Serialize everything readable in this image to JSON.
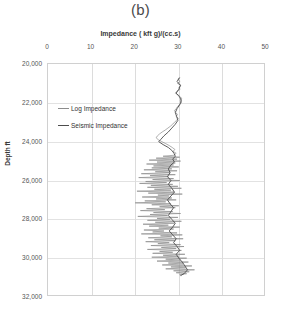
{
  "panel_label": "(b)",
  "axis": {
    "x_title": "Impedance ( kft g)/(cc.s)",
    "y_title": "Depth ft",
    "x_ticks": [
      "0",
      "10",
      "20",
      "30",
      "40",
      "50"
    ],
    "y_ticks": [
      "20,000",
      "22,000",
      "24,000",
      "26,000",
      "28,000",
      "30,000",
      "32,000"
    ]
  },
  "legend": {
    "items": [
      {
        "label": "Log Impedance",
        "color": "#8c8c8c"
      },
      {
        "label": "Seismic Impedance",
        "color": "#4d4d4d"
      }
    ]
  },
  "chart_data": {
    "type": "line",
    "title": "(b)",
    "xlabel": "Impedance ( kft g)/(cc.s)",
    "ylabel": "Depth ft",
    "xlim": [
      0,
      50
    ],
    "ylim": [
      32000,
      20000
    ],
    "y_inverted": true,
    "grid": true,
    "legend_position": "inside-upper-left",
    "xticks": [
      0,
      10,
      20,
      30,
      40,
      50
    ],
    "yticks": [
      20000,
      22000,
      24000,
      26000,
      28000,
      30000,
      32000
    ],
    "series": [
      {
        "name": "Seismic Impedance",
        "color": "#4d4d4d",
        "linewidth": 0.9,
        "comment": "smooth low-frequency trend, depth ft vs impedance kft g/(cc.s)",
        "points": [
          [
            20700,
            30.2
          ],
          [
            20900,
            29.6
          ],
          [
            21100,
            30.4
          ],
          [
            21300,
            30.0
          ],
          [
            21500,
            29.4
          ],
          [
            21700,
            30.2
          ],
          [
            21900,
            30.6
          ],
          [
            22100,
            30.2
          ],
          [
            22300,
            29.6
          ],
          [
            22500,
            29.2
          ],
          [
            22700,
            29.5
          ],
          [
            22900,
            29.8
          ],
          [
            23100,
            29.2
          ],
          [
            23300,
            28.4
          ],
          [
            23500,
            27.6
          ],
          [
            23700,
            26.6
          ],
          [
            23900,
            25.8
          ],
          [
            24000,
            25.4
          ],
          [
            24150,
            26.4
          ],
          [
            24300,
            27.6
          ],
          [
            24450,
            28.4
          ],
          [
            24600,
            28.9
          ],
          [
            24750,
            29.2
          ],
          [
            24900,
            28.6
          ],
          [
            25050,
            29.0
          ],
          [
            25200,
            28.2
          ],
          [
            25400,
            27.6
          ],
          [
            25600,
            28.0
          ],
          [
            25800,
            27.4
          ],
          [
            26000,
            28.2
          ],
          [
            26200,
            27.6
          ],
          [
            26400,
            28.4
          ],
          [
            26600,
            29.0
          ],
          [
            26800,
            28.2
          ],
          [
            27000,
            27.4
          ],
          [
            27200,
            28.0
          ],
          [
            27400,
            28.8
          ],
          [
            27600,
            28.2
          ],
          [
            27800,
            27.6
          ],
          [
            28000,
            28.4
          ],
          [
            28200,
            29.2
          ],
          [
            28400,
            28.6
          ],
          [
            28600,
            27.8
          ],
          [
            28800,
            28.6
          ],
          [
            29000,
            29.4
          ],
          [
            29200,
            28.8
          ],
          [
            29400,
            29.6
          ],
          [
            29600,
            30.2
          ],
          [
            29800,
            29.4
          ],
          [
            30000,
            30.0
          ],
          [
            30200,
            30.8
          ],
          [
            30400,
            31.4
          ],
          [
            30600,
            32.0
          ],
          [
            30800,
            31.2
          ],
          [
            30900,
            30.4
          ]
        ]
      },
      {
        "name": "Log Impedance",
        "color": "#8c8c8c",
        "linewidth": 0.7,
        "comment": "high-frequency well-log trace; amplitude small above ~24,700 ft, large below",
        "points": [
          [
            20700,
            30.1
          ],
          [
            20800,
            29.8
          ],
          [
            20900,
            30.3
          ],
          [
            21000,
            29.7
          ],
          [
            21100,
            30.5
          ],
          [
            21200,
            30.0
          ],
          [
            21300,
            30.3
          ],
          [
            21400,
            29.6
          ],
          [
            21500,
            29.2
          ],
          [
            21600,
            29.9
          ],
          [
            21700,
            30.4
          ],
          [
            21800,
            30.7
          ],
          [
            21900,
            30.3
          ],
          [
            22000,
            30.6
          ],
          [
            22100,
            30.1
          ],
          [
            22200,
            29.7
          ],
          [
            22300,
            29.4
          ],
          [
            22400,
            29.0
          ],
          [
            22500,
            29.3
          ],
          [
            22600,
            29.7
          ],
          [
            22700,
            29.4
          ],
          [
            22800,
            29.9
          ],
          [
            22900,
            29.5
          ],
          [
            23000,
            29.0
          ],
          [
            23100,
            28.6
          ],
          [
            23200,
            28.1
          ],
          [
            23300,
            27.5
          ],
          [
            23400,
            26.9
          ],
          [
            23500,
            26.2
          ],
          [
            23600,
            25.6
          ],
          [
            23700,
            25.1
          ],
          [
            23800,
            24.8
          ],
          [
            23900,
            25.3
          ],
          [
            24000,
            26.1
          ],
          [
            24100,
            27.0
          ],
          [
            24200,
            27.8
          ],
          [
            24300,
            28.5
          ],
          [
            24400,
            29.1
          ],
          [
            24500,
            28.7
          ],
          [
            24600,
            29.4
          ],
          [
            24700,
            28.9
          ],
          [
            24750,
            26.4
          ],
          [
            24800,
            30.2
          ],
          [
            24850,
            24.8
          ],
          [
            24900,
            29.6
          ],
          [
            24950,
            23.2
          ],
          [
            25000,
            30.4
          ],
          [
            25050,
            25.0
          ],
          [
            25100,
            29.2
          ],
          [
            25150,
            22.6
          ],
          [
            25200,
            28.8
          ],
          [
            25250,
            24.2
          ],
          [
            25300,
            30.0
          ],
          [
            25350,
            23.8
          ],
          [
            25400,
            28.4
          ],
          [
            25450,
            22.0
          ],
          [
            25500,
            29.6
          ],
          [
            25550,
            24.6
          ],
          [
            25600,
            28.0
          ],
          [
            25650,
            21.4
          ],
          [
            25700,
            29.2
          ],
          [
            25750,
            23.4
          ],
          [
            25800,
            27.6
          ],
          [
            25850,
            20.8
          ],
          [
            25900,
            28.8
          ],
          [
            25950,
            24.0
          ],
          [
            26000,
            30.2
          ],
          [
            26050,
            22.4
          ],
          [
            26100,
            27.2
          ],
          [
            26150,
            21.0
          ],
          [
            26200,
            28.6
          ],
          [
            26250,
            23.6
          ],
          [
            26300,
            29.8
          ],
          [
            26350,
            22.8
          ],
          [
            26400,
            30.6
          ],
          [
            26450,
            24.4
          ],
          [
            26500,
            28.2
          ],
          [
            26550,
            20.4
          ],
          [
            26600,
            29.0
          ],
          [
            26650,
            23.0
          ],
          [
            26700,
            30.8
          ],
          [
            26750,
            25.2
          ],
          [
            26800,
            27.8
          ],
          [
            26850,
            21.6
          ],
          [
            26900,
            28.4
          ],
          [
            26950,
            24.8
          ],
          [
            27000,
            29.4
          ],
          [
            27050,
            22.2
          ],
          [
            27100,
            27.0
          ],
          [
            27150,
            20.0
          ],
          [
            27200,
            28.2
          ],
          [
            27250,
            23.8
          ],
          [
            27300,
            30.0
          ],
          [
            27350,
            25.6
          ],
          [
            27400,
            29.2
          ],
          [
            27450,
            22.6
          ],
          [
            27500,
            26.8
          ],
          [
            27550,
            21.2
          ],
          [
            27600,
            28.6
          ],
          [
            27650,
            24.2
          ],
          [
            27700,
            30.4
          ],
          [
            27750,
            23.4
          ],
          [
            27800,
            27.4
          ],
          [
            27850,
            20.6
          ],
          [
            27900,
            29.8
          ],
          [
            27950,
            25.0
          ],
          [
            28000,
            28.0
          ],
          [
            28050,
            22.8
          ],
          [
            28100,
            30.6
          ],
          [
            28150,
            24.6
          ],
          [
            28200,
            29.0
          ],
          [
            28250,
            21.8
          ],
          [
            28300,
            27.6
          ],
          [
            28350,
            23.2
          ],
          [
            28400,
            30.2
          ],
          [
            28450,
            25.4
          ],
          [
            28500,
            28.8
          ],
          [
            28550,
            22.0
          ],
          [
            28600,
            26.6
          ],
          [
            28650,
            24.0
          ],
          [
            28700,
            29.6
          ],
          [
            28750,
            21.4
          ],
          [
            28800,
            30.8
          ],
          [
            28850,
            25.8
          ],
          [
            28900,
            28.4
          ],
          [
            28950,
            23.0
          ],
          [
            29000,
            31.0
          ],
          [
            29050,
            24.4
          ],
          [
            29100,
            29.2
          ],
          [
            29150,
            22.4
          ],
          [
            29200,
            27.8
          ],
          [
            29250,
            25.2
          ],
          [
            29300,
            30.4
          ],
          [
            29350,
            23.6
          ],
          [
            29400,
            31.2
          ],
          [
            29450,
            26.0
          ],
          [
            29500,
            29.4
          ],
          [
            29550,
            22.8
          ],
          [
            29600,
            30.6
          ],
          [
            29650,
            25.6
          ],
          [
            29700,
            28.6
          ],
          [
            29750,
            24.0
          ],
          [
            29800,
            31.4
          ],
          [
            29850,
            26.4
          ],
          [
            29900,
            30.0
          ],
          [
            29950,
            23.8
          ],
          [
            30000,
            31.8
          ],
          [
            30050,
            27.0
          ],
          [
            30100,
            30.4
          ],
          [
            30150,
            25.0
          ],
          [
            30200,
            32.2
          ],
          [
            30250,
            27.6
          ],
          [
            30300,
            31.0
          ],
          [
            30350,
            26.2
          ],
          [
            30400,
            33.0
          ],
          [
            30450,
            28.2
          ],
          [
            30500,
            31.6
          ],
          [
            30550,
            27.0
          ],
          [
            30600,
            33.6
          ],
          [
            30650,
            28.8
          ],
          [
            30700,
            32.4
          ],
          [
            30750,
            29.4
          ],
          [
            30800,
            31.8
          ],
          [
            30850,
            30.2
          ],
          [
            30900,
            30.6
          ]
        ]
      }
    ]
  }
}
